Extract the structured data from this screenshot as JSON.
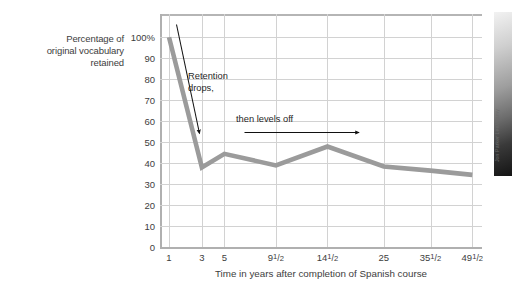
{
  "figure": {
    "background_color": "#ffffff"
  },
  "credit": {
    "text": "Jon Parker Lee/Alamy",
    "image_name": "classroom-photo"
  },
  "annotations": [
    {
      "id": "retention-drops",
      "line1": "Retention",
      "line2": "drops,"
    },
    {
      "id": "then-levels-off",
      "line1": "then levels off",
      "line2": ""
    }
  ],
  "chart_data": {
    "type": "line",
    "title": "",
    "subtitle": "",
    "xlabel": "Time in years after completion of Spanish course",
    "ylabel": "Percentage of original vocabulary retained",
    "ylabel_lines": [
      "Percentage of",
      "original vocabulary",
      "retained"
    ],
    "categories": [
      "1",
      "3",
      "5",
      "9½",
      "14½",
      "25",
      "35½",
      "49½"
    ],
    "x_tick_labels": [
      {
        "whole": "1",
        "num": "",
        "den": ""
      },
      {
        "whole": "3",
        "num": "",
        "den": ""
      },
      {
        "whole": "5",
        "num": "",
        "den": ""
      },
      {
        "whole": "9",
        "num": "1",
        "den": "2"
      },
      {
        "whole": "14",
        "num": "1",
        "den": "2"
      },
      {
        "whole": "25",
        "num": "",
        "den": ""
      },
      {
        "whole": "35",
        "num": "1",
        "den": "2"
      },
      {
        "whole": "49",
        "num": "1",
        "den": "2"
      }
    ],
    "x_positions_pct": [
      2.8,
      13.0,
      20.0,
      36.0,
      52.0,
      69.5,
      84.0,
      97.0
    ],
    "values": [
      100,
      38,
      44.5,
      39,
      48,
      38.5,
      36.5,
      34.5
    ],
    "series": [
      {
        "name": "Percentage of original vocabulary retained",
        "color": "#9b9b9b",
        "values": [
          100,
          38,
          44.5,
          39,
          48,
          38.5,
          36.5,
          34.5
        ]
      }
    ],
    "y_tick_labels": [
      "100%",
      "90",
      "80",
      "70",
      "60",
      "50",
      "40",
      "30",
      "20",
      "10",
      "0"
    ],
    "y_tick_values": [
      100,
      90,
      80,
      70,
      60,
      50,
      40,
      30,
      20,
      10,
      0
    ],
    "ylim": [
      0,
      100
    ],
    "grid": "both",
    "legend": "none",
    "line_color": "#9b9b9b",
    "grid_color": "#d2d2d2",
    "axis_color": "#b0b0b0",
    "annotation_color": "#1f1f1f",
    "annotations": [
      {
        "text": "Retention drops,",
        "arrow": "down-right"
      },
      {
        "text": "then levels off",
        "arrow": "right"
      }
    ]
  }
}
